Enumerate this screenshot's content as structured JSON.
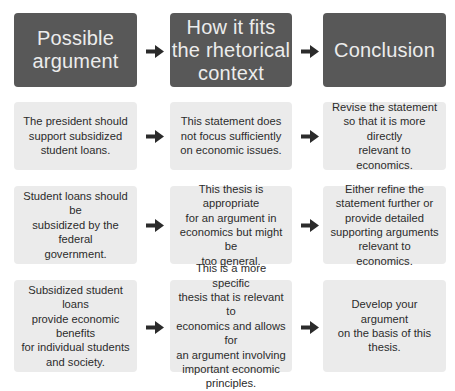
{
  "headers": [
    {
      "label": "Possible\nargument"
    },
    {
      "label": "How it fits\nthe rhetorical\ncontext"
    },
    {
      "label": "Conclusion"
    }
  ],
  "rows": [
    {
      "argument": "The president should\nsupport subsidized\nstudent loans.",
      "context": "This statement does\nnot focus sufficiently\non economic issues.",
      "conclusion": "Revise the statement\nso that it is more directly\nrelevant to economics."
    },
    {
      "argument": "Student loans should be\nsubsidized by the federal\ngovernment.",
      "context": "This thesis is appropriate\nfor an argument in\neconomics but might be\ntoo general.",
      "conclusion": "Either refine the\nstatement further or\nprovide detailed\nsupporting arguments\nrelevant to economics."
    },
    {
      "argument": "Subsidized student loans\nprovide economic benefits\nfor individual students\nand society.",
      "context": "This is a more specific\nthesis that is relevant to\neconomics and allows for\nan argument involving\nimportant economic\nprinciples.",
      "conclusion": "Develop your argument\non the basis of this thesis."
    }
  ],
  "icons": {
    "arrow": "arrow-right-icon"
  },
  "colors": {
    "header_bg": "#585858",
    "header_text": "#ececec",
    "cell_bg": "#ebebeb",
    "cell_text": "#2b2b2b",
    "arrow": "#2b2b2b"
  }
}
